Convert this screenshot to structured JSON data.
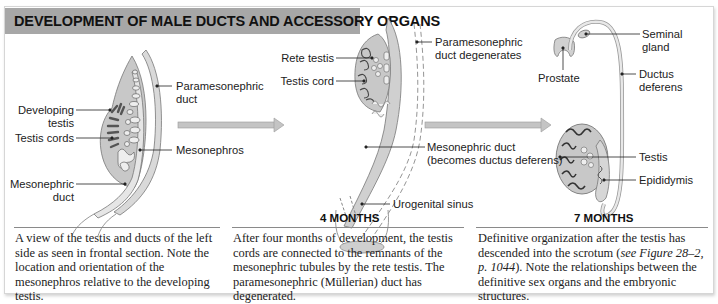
{
  "title": "DEVELOPMENT OF MALE DUCTS AND ACCESSORY ORGANS",
  "colors": {
    "title_bar": "#a7a7a7",
    "organ_fill": "#c8c8c8",
    "duct_fill": "#d9d9d9",
    "cord_dark": "#555555",
    "arrow": "#bdbdbd"
  },
  "panels": [
    {
      "stage": "",
      "labels": {
        "paramesonephric_duct_1": "Paramesonephric",
        "paramesonephric_duct_2": "duct",
        "developing_testis_1": "Developing",
        "developing_testis_2": "testis",
        "testis_cords": "Testis cords",
        "mesonephros": "Mesonephros",
        "mesonephric_duct_1": "Mesonephric",
        "mesonephric_duct_2": "duct"
      },
      "caption": "A view of the testis and ducts of the left side as seen in frontal section. Note the location and orientation of the mesonephros relative to the developing testis."
    },
    {
      "stage": "4 MONTHS",
      "labels": {
        "rete_testis": "Rete testis",
        "testis_cord": "Testis cord",
        "paramesonephric_degenerates_1": "Paramesonephric",
        "paramesonephric_degenerates_2": "duct degenerates",
        "mesonephric_duct_1": "Mesonephric duct",
        "mesonephric_duct_2": "(becomes ductus deferens)",
        "urogenital_sinus": "Urogenital sinus"
      },
      "caption": "After four months of development, the testis cords are connected to the remnants of the mesonephric tubules by the rete testis. The paramesonephric (Müllerian) duct has degenerated."
    },
    {
      "stage": "7 MONTHS",
      "labels": {
        "seminal_gland_1": "Seminal",
        "seminal_gland_2": "gland",
        "prostate": "Prostate",
        "ductus_deferens_1": "Ductus",
        "ductus_deferens_2": "deferens",
        "testis": "Testis",
        "epididymis": "Epididymis"
      },
      "caption_pre": "Definitive organization after the testis has descended into the scrotum (",
      "caption_ref": "see Figure 28–2, p. 1044",
      "caption_post": "). Note the relationships between the definitive sex organs and the embryonic structures."
    }
  ]
}
